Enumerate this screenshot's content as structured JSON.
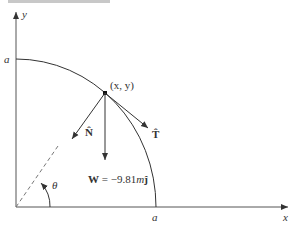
{
  "diagram": {
    "axes": {
      "x_label": "x",
      "y_label": "y"
    },
    "radius_label_x": "a",
    "radius_label_y": "a",
    "point_label": "(x, y)",
    "normal_label": "N̂",
    "tangent_label": "T̂",
    "weight_label_bold": "W",
    "weight_label_eq": " = −9.81",
    "weight_label_m": "m",
    "weight_label_j": "ĵ",
    "angle_label": "θ",
    "colors": {
      "line": "#333333",
      "dashed": "#777777",
      "topbar": "#c8c8c8"
    }
  }
}
